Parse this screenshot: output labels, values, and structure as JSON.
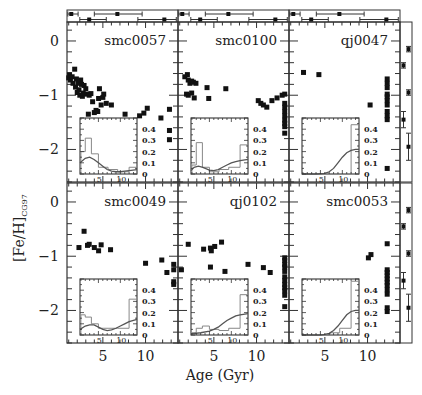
{
  "chart_data": {
    "type": "scatter",
    "title": "",
    "xlabel": "Age (Gyr)",
    "ylabel": "[Fe/H]_CG97",
    "ylabel_main": "[Fe/H]",
    "ylabel_sub": "CG97",
    "xlim": [
      0.8,
      13.8
    ],
    "ylim": [
      -2.6,
      0.35
    ],
    "x_ticks": [
      5,
      10
    ],
    "y_ticks": [
      0,
      -1,
      -2
    ],
    "grid": false,
    "layout": "2x3 panels with inset histograms, top error-bar strip and right error-bar strip",
    "colors": {
      "points": "#111111",
      "axes": "#333333",
      "inset_hist": "#888888",
      "inset_curve": "#555555"
    },
    "inset": {
      "xlim": [
        0.8,
        13.8
      ],
      "ylim": [
        0,
        0.5
      ],
      "x_ticks": [
        5,
        10
      ],
      "y_ticks": [
        0,
        0.1,
        0.2,
        0.3,
        0.4
      ],
      "y_tick_labels": [
        "0",
        "0.1",
        "0.2",
        "0.3",
        "0.4"
      ]
    },
    "panels": [
      {
        "name": "smc0057",
        "points": [
          [
            1.0,
            -0.68
          ],
          [
            1.1,
            -0.62
          ],
          [
            1.2,
            -0.72
          ],
          [
            1.4,
            -0.66
          ],
          [
            1.5,
            -0.78
          ],
          [
            1.7,
            -0.52
          ],
          [
            1.8,
            -0.85
          ],
          [
            1.9,
            -0.7
          ],
          [
            2.0,
            -0.95
          ],
          [
            2.1,
            -0.78
          ],
          [
            2.2,
            -0.9
          ],
          [
            2.3,
            -1.0
          ],
          [
            2.4,
            -0.72
          ],
          [
            2.5,
            -0.8
          ],
          [
            2.6,
            -1.02
          ],
          [
            2.7,
            -0.96
          ],
          [
            2.8,
            -0.82
          ],
          [
            3.0,
            -0.88
          ],
          [
            3.1,
            -0.98
          ],
          [
            3.3,
            -1.35
          ],
          [
            3.4,
            -1.0
          ],
          [
            3.6,
            -0.97
          ],
          [
            3.8,
            -1.12
          ],
          [
            4.0,
            -1.32
          ],
          [
            4.2,
            -1.28
          ],
          [
            4.4,
            -1.3
          ],
          [
            4.5,
            -1.06
          ],
          [
            4.6,
            -0.88
          ],
          [
            4.8,
            -1.18
          ],
          [
            5.0,
            -1.04
          ],
          [
            5.1,
            -0.98
          ],
          [
            5.4,
            -1.15
          ],
          [
            6.0,
            -1.18
          ],
          [
            7.6,
            -1.35
          ],
          [
            9.3,
            -1.38
          ],
          [
            9.8,
            -1.33
          ],
          [
            10.2,
            -1.24
          ],
          [
            11.8,
            -1.42
          ],
          [
            12.8,
            -1.26
          ],
          [
            12.8,
            -1.65
          ],
          [
            12.8,
            -1.82
          ]
        ],
        "hist": [
          0.1,
          0.2,
          0.3,
          0.1,
          0.0,
          0.0,
          0.0,
          0.0,
          0.0,
          0.0,
          0.0,
          0.0
        ],
        "hist_bins": [
          [
            1,
            2,
            0.2
          ],
          [
            2,
            3.4,
            0.32
          ],
          [
            3.4,
            5,
            0.18
          ],
          [
            5,
            7.2,
            0.06
          ],
          [
            7.2,
            9.4,
            0.04
          ],
          [
            9.4,
            12,
            0.02
          ],
          [
            12,
            13.8,
            0.06
          ]
        ],
        "curve": [
          [
            0.8,
            0.1
          ],
          [
            2,
            0.14
          ],
          [
            3,
            0.15
          ],
          [
            4,
            0.13
          ],
          [
            5,
            0.1
          ],
          [
            6,
            0.07
          ],
          [
            7,
            0.04
          ],
          [
            8,
            0.025
          ],
          [
            9,
            0.02
          ],
          [
            10,
            0.02
          ],
          [
            11,
            0.025
          ],
          [
            12,
            0.03
          ],
          [
            13.8,
            0.04
          ]
        ]
      },
      {
        "name": "smc0100",
        "points": [
          [
            1.6,
            -0.66
          ],
          [
            1.9,
            -0.62
          ],
          [
            2.0,
            -0.72
          ],
          [
            2.2,
            -0.78
          ],
          [
            2.4,
            -0.74
          ],
          [
            2.6,
            -0.76
          ],
          [
            2.9,
            -0.78
          ],
          [
            1.8,
            -0.98
          ],
          [
            2.0,
            -1.0
          ],
          [
            2.4,
            -0.96
          ],
          [
            2.7,
            -1.05
          ],
          [
            4.2,
            -0.86
          ],
          [
            4.4,
            -1.06
          ],
          [
            6.4,
            -0.88
          ],
          [
            10.2,
            -1.1
          ],
          [
            10.5,
            -1.15
          ],
          [
            10.8,
            -1.18
          ],
          [
            11.2,
            -1.22
          ],
          [
            11.8,
            -1.1
          ],
          [
            12.4,
            -1.05
          ],
          [
            13.0,
            -1.0
          ],
          [
            13.3,
            -0.98
          ],
          [
            13.3,
            -1.15
          ],
          [
            13.3,
            -1.22
          ],
          [
            13.3,
            -1.3
          ],
          [
            13.3,
            -1.38
          ],
          [
            13.3,
            -1.46
          ],
          [
            13.3,
            -1.52
          ],
          [
            13.3,
            -1.58
          ],
          [
            13.3,
            -1.7
          ]
        ],
        "hist_bins": [
          [
            1,
            2,
            0.08
          ],
          [
            2,
            3.4,
            0.28
          ],
          [
            3.4,
            5,
            0.06
          ],
          [
            5,
            7.2,
            0.02
          ],
          [
            7.2,
            9.4,
            0.04
          ],
          [
            9.4,
            12,
            0.06
          ],
          [
            12,
            13.8,
            0.26
          ]
        ],
        "curve": [
          [
            0.8,
            0.03
          ],
          [
            1.5,
            0.06
          ],
          [
            2.5,
            0.07
          ],
          [
            3.5,
            0.06
          ],
          [
            5,
            0.035
          ],
          [
            6,
            0.03
          ],
          [
            7,
            0.04
          ],
          [
            8,
            0.06
          ],
          [
            9,
            0.08
          ],
          [
            10,
            0.1
          ],
          [
            11,
            0.11
          ],
          [
            12,
            0.12
          ],
          [
            13.8,
            0.13
          ]
        ]
      },
      {
        "name": "qj0047",
        "points": [
          [
            2.5,
            -0.58
          ],
          [
            4.3,
            -0.62
          ],
          [
            10.3,
            -1.18
          ],
          [
            12.3,
            -0.7
          ],
          [
            12.3,
            -0.78
          ],
          [
            12.3,
            -0.86
          ],
          [
            12.3,
            -0.98
          ],
          [
            12.3,
            -1.03
          ],
          [
            12.3,
            -1.1
          ],
          [
            12.3,
            -1.18
          ],
          [
            12.3,
            -1.3
          ],
          [
            12.3,
            -1.38
          ],
          [
            12.3,
            -1.45
          ],
          [
            12.3,
            -2.35
          ]
        ],
        "hist_bins": [
          [
            1,
            12,
            0.0
          ],
          [
            12,
            13.8,
            0.44
          ]
        ],
        "curve": [
          [
            0.8,
            0.0
          ],
          [
            4,
            0.0
          ],
          [
            6,
            0.005
          ],
          [
            7,
            0.02
          ],
          [
            8,
            0.05
          ],
          [
            9,
            0.1
          ],
          [
            10,
            0.15
          ],
          [
            11,
            0.19
          ],
          [
            12,
            0.21
          ],
          [
            13,
            0.22
          ],
          [
            13.8,
            0.22
          ]
        ]
      },
      {
        "name": "smc0049",
        "points": [
          [
            2.2,
            -0.84
          ],
          [
            2.8,
            -0.54
          ],
          [
            3.2,
            -0.8
          ],
          [
            3.4,
            -0.78
          ],
          [
            4.0,
            -0.84
          ],
          [
            4.5,
            -0.9
          ],
          [
            4.8,
            -0.79
          ],
          [
            5.9,
            -0.88
          ],
          [
            10.0,
            -1.13
          ],
          [
            11.9,
            -1.07
          ],
          [
            12.5,
            -1.3
          ],
          [
            13.3,
            -1.15
          ],
          [
            13.3,
            -1.25
          ],
          [
            13.3,
            -1.47
          ],
          [
            13.3,
            -1.52
          ]
        ],
        "hist_bins": [
          [
            1,
            2,
            0.18
          ],
          [
            2,
            3.4,
            0.16
          ],
          [
            3.4,
            5,
            0.1
          ],
          [
            5,
            7.2,
            0.06
          ],
          [
            7.2,
            9.4,
            0.06
          ],
          [
            9.4,
            12,
            0.06
          ],
          [
            12,
            13.8,
            0.32
          ]
        ],
        "curve": [
          [
            0.8,
            0.05
          ],
          [
            2,
            0.08
          ],
          [
            3,
            0.09
          ],
          [
            4,
            0.09
          ],
          [
            5,
            0.07
          ],
          [
            6,
            0.05
          ],
          [
            7,
            0.04
          ],
          [
            8,
            0.045
          ],
          [
            9,
            0.06
          ],
          [
            10,
            0.08
          ],
          [
            11,
            0.1
          ],
          [
            12,
            0.12
          ],
          [
            13.8,
            0.14
          ]
        ]
      },
      {
        "name": "qj0102",
        "points": [
          [
            1.2,
            -1.25
          ],
          [
            2.0,
            -0.78
          ],
          [
            3.8,
            -0.87
          ],
          [
            4.6,
            -0.85
          ],
          [
            4.7,
            -0.9
          ],
          [
            5.1,
            -0.82
          ],
          [
            5.9,
            -0.74
          ],
          [
            4.6,
            -1.2
          ],
          [
            6.3,
            -1.28
          ],
          [
            9.0,
            -1.15
          ],
          [
            10.8,
            -1.21
          ],
          [
            11.6,
            -1.3
          ],
          [
            13.3,
            -1.03
          ],
          [
            13.3,
            -1.08
          ],
          [
            13.3,
            -1.15
          ],
          [
            13.3,
            -1.2
          ],
          [
            13.3,
            -1.28
          ],
          [
            13.3,
            -1.38
          ],
          [
            13.3,
            -1.45
          ],
          [
            13.3,
            -1.52
          ],
          [
            13.3,
            -1.58
          ],
          [
            13.3,
            -1.64
          ],
          [
            13.3,
            -1.72
          ],
          [
            13.3,
            -1.93
          ]
        ],
        "hist_bins": [
          [
            1,
            2,
            0.02
          ],
          [
            2,
            3.4,
            0.06
          ],
          [
            3.4,
            5,
            0.08
          ],
          [
            5,
            7.2,
            0.05
          ],
          [
            7.2,
            9.4,
            0.04
          ],
          [
            9.4,
            12,
            0.06
          ],
          [
            12,
            13.8,
            0.36
          ]
        ],
        "curve": [
          [
            0.8,
            0.01
          ],
          [
            3,
            0.02
          ],
          [
            5,
            0.035
          ],
          [
            6,
            0.05
          ],
          [
            7,
            0.07
          ],
          [
            8,
            0.1
          ],
          [
            9,
            0.13
          ],
          [
            10,
            0.15
          ],
          [
            11,
            0.17
          ],
          [
            12,
            0.18
          ],
          [
            13.8,
            0.19
          ]
        ]
      },
      {
        "name": "smc0053",
        "points": [
          [
            10.1,
            -1.03
          ],
          [
            10.4,
            -0.97
          ],
          [
            12.3,
            -0.77
          ],
          [
            12.3,
            -1.25
          ],
          [
            12.3,
            -1.3
          ],
          [
            12.3,
            -1.36
          ],
          [
            12.3,
            -1.42
          ],
          [
            12.3,
            -1.48
          ],
          [
            12.3,
            -1.54
          ],
          [
            12.3,
            -1.62
          ],
          [
            12.3,
            -1.7
          ],
          [
            12.3,
            -1.95
          ],
          [
            12.3,
            -2.02
          ]
        ],
        "hist_bins": [
          [
            1,
            7.2,
            0.0
          ],
          [
            7.2,
            9.4,
            0.02
          ],
          [
            9.4,
            12,
            0.06
          ],
          [
            12,
            13.8,
            0.48
          ]
        ],
        "curve": [
          [
            0.8,
            0.0
          ],
          [
            5,
            0.0
          ],
          [
            6,
            0.005
          ],
          [
            7,
            0.015
          ],
          [
            8,
            0.04
          ],
          [
            9,
            0.08
          ],
          [
            10,
            0.13
          ],
          [
            11,
            0.18
          ],
          [
            12,
            0.21
          ],
          [
            13,
            0.22
          ],
          [
            13.8,
            0.22
          ]
        ]
      }
    ],
    "top_errorbars": [
      [
        {
          "x": 1.3,
          "lo": 0.9,
          "hi": 2.1,
          "row": 0
        },
        {
          "x": 6.7,
          "lo": 4.0,
          "hi": 9.6,
          "row": 0
        },
        {
          "x": 3.4,
          "lo": 2.3,
          "hi": 5.4,
          "row": 1
        },
        {
          "x": 12.2,
          "lo": 9.1,
          "hi": 13.6,
          "row": 1
        }
      ],
      [
        {
          "x": 1.3,
          "lo": 0.9,
          "hi": 2.1,
          "row": 0
        },
        {
          "x": 6.7,
          "lo": 4.0,
          "hi": 9.6,
          "row": 0
        },
        {
          "x": 3.4,
          "lo": 2.3,
          "hi": 5.4,
          "row": 1
        },
        {
          "x": 12.2,
          "lo": 9.1,
          "hi": 13.6,
          "row": 1
        }
      ],
      [
        {
          "x": 1.3,
          "lo": 0.9,
          "hi": 2.1,
          "row": 0
        },
        {
          "x": 6.7,
          "lo": 4.0,
          "hi": 9.6,
          "row": 0
        },
        {
          "x": 3.4,
          "lo": 2.3,
          "hi": 5.4,
          "row": 1
        },
        {
          "x": 12.2,
          "lo": 9.1,
          "hi": 13.6,
          "row": 1
        }
      ]
    ],
    "right_errorbars": [
      [
        {
          "y": -0.15,
          "lo": -0.2,
          "hi": -0.1,
          "col": 1
        },
        {
          "y": -0.45,
          "lo": -0.5,
          "hi": -0.4,
          "col": 0
        },
        {
          "y": -0.95,
          "lo": -1.0,
          "hi": -0.9,
          "col": 1
        },
        {
          "y": -1.45,
          "lo": -1.6,
          "hi": -1.3,
          "col": 0
        },
        {
          "y": -1.95,
          "lo": -2.2,
          "hi": -1.7,
          "col": 1
        }
      ],
      [
        {
          "y": -0.15,
          "lo": -0.2,
          "hi": -0.1,
          "col": 1
        },
        {
          "y": -0.45,
          "lo": -0.5,
          "hi": -0.4,
          "col": 0
        },
        {
          "y": -0.95,
          "lo": -1.0,
          "hi": -0.9,
          "col": 1
        },
        {
          "y": -1.45,
          "lo": -1.6,
          "hi": -1.3,
          "col": 0
        },
        {
          "y": -1.95,
          "lo": -2.2,
          "hi": -1.7,
          "col": 1
        }
      ]
    ]
  }
}
